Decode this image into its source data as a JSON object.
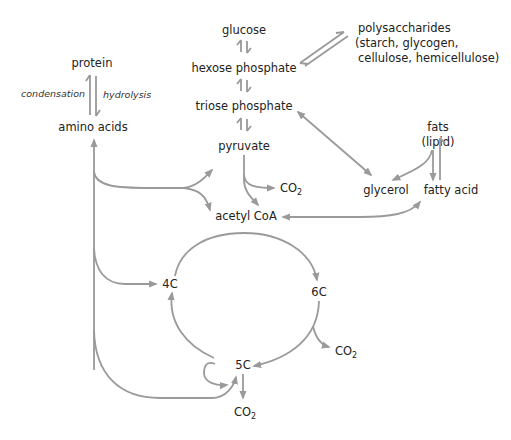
{
  "colors": {
    "arrow": "#9a9a9a",
    "text": "#222222",
    "background": "#ffffff"
  },
  "nodes": {
    "glucose": "glucose",
    "hexose_phosphate": "hexose phosphate",
    "triose_phosphate": "triose phosphate",
    "pyruvate": "pyruvate",
    "acetyl_coa": "acetyl CoA",
    "polysaccharides": [
      "polysaccharides",
      "(starch, glycogen,",
      "cellulose, hemicellulose)"
    ],
    "protein": "protein",
    "amino_acids": "amino acids",
    "fats": [
      "fats",
      "(lipid)"
    ],
    "glycerol": "glycerol",
    "fatty_acid": "fatty acid",
    "c4": "4C",
    "c6": "6C",
    "c5": "5C"
  },
  "reaction_labels": {
    "condensation": "condensation",
    "hydrolysis": "hydrolysis"
  },
  "products": {
    "co2_main": "CO",
    "co2_sub": "2"
  },
  "edges": [
    {
      "from": "glucose",
      "to": "hexose phosphate",
      "type": "reversible"
    },
    {
      "from": "hexose phosphate",
      "to": "triose phosphate",
      "type": "reversible"
    },
    {
      "from": "triose phosphate",
      "to": "pyruvate",
      "type": "reversible"
    },
    {
      "from": "hexose phosphate",
      "to": "polysaccharides",
      "type": "reversible"
    },
    {
      "from": "protein",
      "to": "amino acids",
      "type": "reversible"
    },
    {
      "from": "triose phosphate",
      "to": "glycerol",
      "type": "bidirectional"
    },
    {
      "from": "fats",
      "to": "glycerol",
      "type": "forward"
    },
    {
      "from": "fats",
      "to": "fatty acid",
      "type": "reversible"
    },
    {
      "from": "fatty acid",
      "to": "acetyl CoA",
      "type": "bidirectional"
    },
    {
      "from": "pyruvate",
      "to": "acetyl CoA",
      "type": "forward"
    },
    {
      "from": "pyruvate",
      "to": "CO2",
      "type": "forward"
    },
    {
      "from": "amino acids",
      "to": "pyruvate",
      "type": "bidirectional"
    },
    {
      "from": "amino acids",
      "to": "acetyl CoA",
      "type": "forward"
    },
    {
      "from": "amino acids",
      "to": "4C",
      "type": "bidirectional"
    },
    {
      "from": "amino acids",
      "to": "5C",
      "type": "bidirectional"
    },
    {
      "from": "acetyl CoA",
      "to": "6C",
      "type": "forward"
    },
    {
      "from": "4C",
      "to": "6C",
      "type": "forward"
    },
    {
      "from": "6C",
      "to": "5C",
      "type": "forward"
    },
    {
      "from": "6C",
      "to": "CO2",
      "type": "forward"
    },
    {
      "from": "5C",
      "to": "4C",
      "type": "forward"
    },
    {
      "from": "5C",
      "to": "CO2",
      "type": "forward"
    }
  ]
}
